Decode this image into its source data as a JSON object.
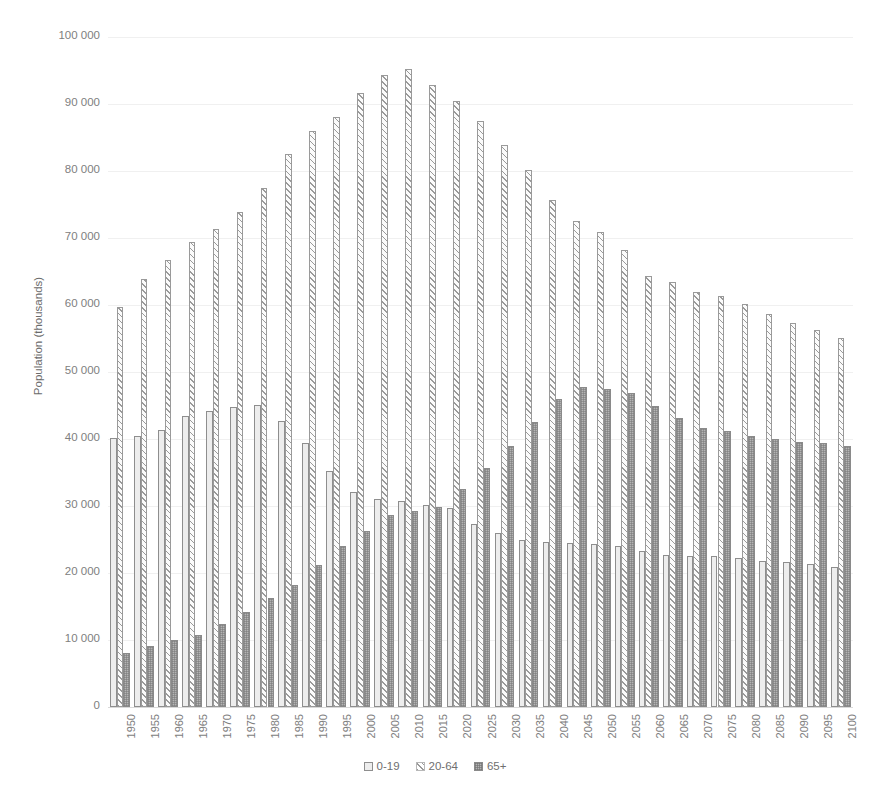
{
  "top_caption_sliver": "",
  "chart_data": {
    "type": "bar",
    "title": "",
    "subtitle": "",
    "xlabel": "",
    "ylabel": "Population (thousands)",
    "ylim": [
      0,
      100000
    ],
    "ytick_step": 10000,
    "ytick_labels": [
      "0",
      "10 000",
      "20 000",
      "30 000",
      "40 000",
      "50 000",
      "60 000",
      "70 000",
      "80 000",
      "90 000",
      "100 000"
    ],
    "grid": true,
    "legend_position": "bottom",
    "categories": [
      "1950",
      "1955",
      "1960",
      "1965",
      "1970",
      "1975",
      "1980",
      "1985",
      "1990",
      "1995",
      "2000",
      "2005",
      "2010",
      "2015",
      "2020",
      "2025",
      "2030",
      "2035",
      "2040",
      "2045",
      "2050",
      "2055",
      "2060",
      "2065",
      "2070",
      "2075",
      "2080",
      "2085",
      "2090",
      "2095",
      "2100"
    ],
    "series": [
      {
        "name": "0-19",
        "pattern": "solid-light",
        "color": "#ededed",
        "values": [
          40200,
          40500,
          41300,
          43400,
          44200,
          44800,
          45100,
          42700,
          39400,
          35300,
          32100,
          31000,
          30800,
          30200,
          29700,
          27300,
          26000,
          25000,
          24700,
          24500,
          24400,
          24000,
          23300,
          22700,
          22600,
          22500,
          22200,
          21800,
          21600,
          21400,
          20900
        ]
      },
      {
        "name": "20-64",
        "pattern": "diagonal-hatch",
        "color": "#9a9a9a",
        "values": [
          59700,
          63900,
          66700,
          69400,
          71400,
          73900,
          77400,
          82600,
          85900,
          88100,
          91700,
          94400,
          95200,
          92800,
          90400,
          87500,
          83900,
          80200,
          75600,
          72600,
          70900,
          68200,
          64400,
          63400,
          62000,
          61300,
          60200,
          58600,
          57300,
          56300,
          55100
        ]
      },
      {
        "name": "65+",
        "pattern": "crosshatch-dark",
        "color": "#b4b4b4",
        "values": [
          8000,
          9100,
          10000,
          10800,
          12400,
          14200,
          16200,
          18200,
          21200,
          24000,
          26200,
          28700,
          29300,
          29900,
          32600,
          35700,
          39000,
          42600,
          46000,
          47700,
          47500,
          46800,
          45000,
          43200,
          41600,
          41200,
          40500,
          40000,
          39600,
          39400,
          38900
        ]
      }
    ],
    "legend": [
      "0-19",
      "20-64",
      "65+"
    ]
  }
}
